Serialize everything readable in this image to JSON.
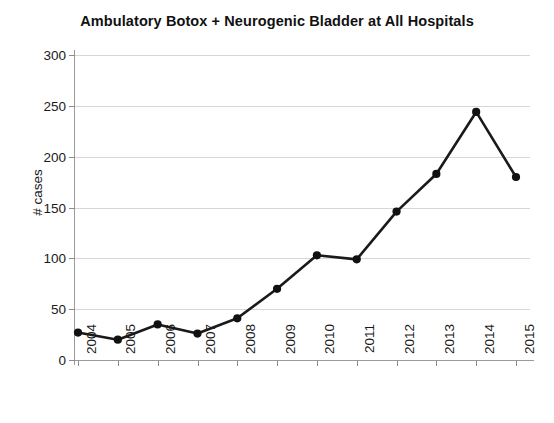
{
  "chart_data": {
    "type": "line",
    "title": "Ambulatory Botox + Neurogenic Bladder at All Hospitals",
    "xlabel": "",
    "ylabel": "# cases",
    "categories": [
      "2004",
      "2005",
      "2006",
      "2007",
      "2008",
      "2009",
      "2010",
      "2011",
      "2012",
      "2013",
      "2014",
      "2015"
    ],
    "values": [
      27,
      20,
      35,
      26,
      41,
      70,
      103,
      99,
      146,
      183,
      244,
      180
    ],
    "series": [
      {
        "name": "# cases",
        "values": [
          27,
          20,
          35,
          26,
          41,
          70,
          103,
          99,
          146,
          183,
          244,
          180
        ]
      }
    ],
    "ylim": [
      0,
      300
    ],
    "yticks": [
      0,
      50,
      100,
      150,
      200,
      250,
      300
    ],
    "ytick_labels": [
      "0",
      "50",
      "100",
      "150",
      "200",
      "250",
      "300"
    ],
    "grid": true,
    "grid_axis": "y",
    "legend": false,
    "legend_position": "none",
    "line_color": "#1a1a1a",
    "marker": "circle",
    "marker_color": "#111111",
    "background_color": "#ffffff",
    "gridline_color": "#d6d6d6"
  }
}
